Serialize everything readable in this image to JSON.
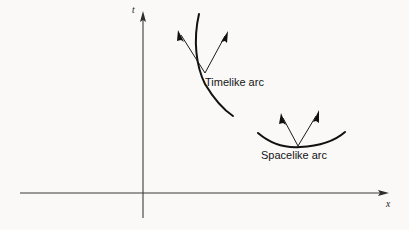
{
  "figure": {
    "background_color": "#faf9f7",
    "line_color": "#111111",
    "axis_color": "#3b3b3b",
    "width": 409,
    "height": 230
  },
  "axes": {
    "x_axis": {
      "label": "x",
      "label_x": 389,
      "label_y": 207,
      "start_x": 20,
      "end_x": 389,
      "y": 193,
      "arrow_tip_x": 389
    },
    "t_axis": {
      "label": "t",
      "label_x": 132,
      "label_y": 13,
      "x": 143,
      "start_y": 218,
      "end_y": 12,
      "arrow_tip_y": 12
    }
  },
  "arcs": [
    {
      "name": "timelike-arc",
      "label": "Timelike arc",
      "label_x": 205,
      "label_y": 86,
      "curve": "M 199 14 C 193 40, 196 66, 205 84 C 214 99, 224 110, 233 116",
      "vectors": [
        {
          "name": "timelike-vector-left",
          "x1": 205,
          "y1": 73,
          "x2": 178,
          "y2": 30
        },
        {
          "name": "timelike-vector-right",
          "x1": 205,
          "y1": 73,
          "x2": 228,
          "y2": 31
        }
      ]
    },
    {
      "name": "spacelike-arc",
      "label": "Spacelike arc",
      "label_x": 261,
      "label_y": 159,
      "curve": "M 258 133 C 272 145, 286 148, 300 147 C 320 146, 336 140, 345 132",
      "vectors": [
        {
          "name": "spacelike-vector-left",
          "x1": 298,
          "y1": 146,
          "x2": 281,
          "y2": 113
        },
        {
          "name": "spacelike-vector-right",
          "x1": 298,
          "y1": 146,
          "x2": 319,
          "y2": 110
        }
      ]
    }
  ]
}
